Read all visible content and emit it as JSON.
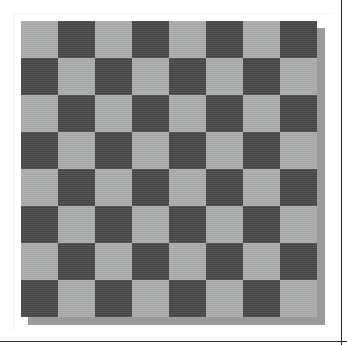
{
  "page": {
    "background_color": "#ffffff",
    "width": 347,
    "height": 345,
    "border_color": "#2b2b2b",
    "rule_color": "#f2f2f2"
  },
  "board": {
    "label": "Checkerboard",
    "rows": 8,
    "columns": 8,
    "square_size_px": 37,
    "origin_x_px": 21,
    "origin_y_px": 21,
    "width_px": 296,
    "height_px": 296,
    "light_color": "#abacac",
    "dark_color": "#4b4b4b",
    "shadow_color": "#9a9a9a",
    "shadow_offset_x_px": 7,
    "shadow_offset_y_px": 7,
    "top_left_square": "light",
    "grid": [
      [
        "light",
        "dark",
        "light",
        "dark",
        "light",
        "dark",
        "light",
        "dark"
      ],
      [
        "dark",
        "light",
        "dark",
        "light",
        "dark",
        "light",
        "dark",
        "light"
      ],
      [
        "light",
        "dark",
        "light",
        "dark",
        "light",
        "dark",
        "light",
        "dark"
      ],
      [
        "dark",
        "light",
        "dark",
        "light",
        "dark",
        "light",
        "dark",
        "light"
      ],
      [
        "light",
        "dark",
        "light",
        "dark",
        "light",
        "dark",
        "light",
        "dark"
      ],
      [
        "dark",
        "light",
        "dark",
        "light",
        "dark",
        "light",
        "dark",
        "light"
      ],
      [
        "light",
        "dark",
        "light",
        "dark",
        "light",
        "dark",
        "light",
        "dark"
      ],
      [
        "dark",
        "light",
        "dark",
        "light",
        "dark",
        "light",
        "dark",
        "light"
      ]
    ]
  }
}
